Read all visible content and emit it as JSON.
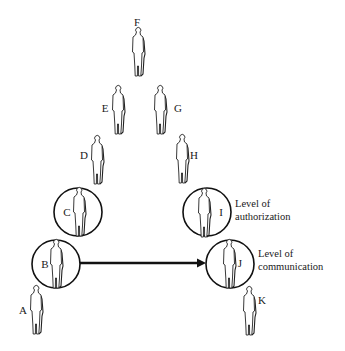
{
  "diagram": {
    "type": "hierarchy-chain",
    "people": [
      {
        "id": "F",
        "label": "F",
        "x": 138,
        "y": 32,
        "circled": false,
        "label_pos": "above"
      },
      {
        "id": "E",
        "label": "E",
        "x": 117,
        "y": 89,
        "circled": false,
        "label_pos": "left"
      },
      {
        "id": "G",
        "label": "G",
        "x": 160,
        "y": 90,
        "circled": false,
        "label_pos": "right"
      },
      {
        "id": "D",
        "label": "D",
        "x": 97,
        "y": 140,
        "circled": false,
        "label_pos": "left"
      },
      {
        "id": "H",
        "label": "H",
        "x": 182,
        "y": 139,
        "circled": false,
        "label_pos": "right"
      },
      {
        "id": "C",
        "label": "C",
        "x": 78,
        "y": 193,
        "circled": true,
        "label_pos": "left"
      },
      {
        "id": "I",
        "label": "I",
        "x": 205,
        "y": 193,
        "circled": true,
        "label_pos": "right"
      },
      {
        "id": "B",
        "label": "B",
        "x": 56,
        "y": 244,
        "circled": true,
        "label_pos": "left"
      },
      {
        "id": "J",
        "label": "J",
        "x": 229,
        "y": 244,
        "circled": true,
        "label_pos": "right"
      },
      {
        "id": "A",
        "label": "A",
        "x": 37,
        "y": 290,
        "circled": false,
        "label_pos": "left"
      },
      {
        "id": "K",
        "label": "K",
        "x": 250,
        "y": 291,
        "circled": false,
        "label_pos": "right"
      }
    ],
    "annotations": [
      {
        "id": "authorization",
        "line1": "Level of",
        "line2": "authorization",
        "target": "I"
      },
      {
        "id": "communication",
        "line1": "Level of",
        "line2": "communication",
        "target": "J"
      }
    ],
    "arrow": {
      "from": "B",
      "to": "J",
      "style": "bold-horizontal"
    }
  }
}
